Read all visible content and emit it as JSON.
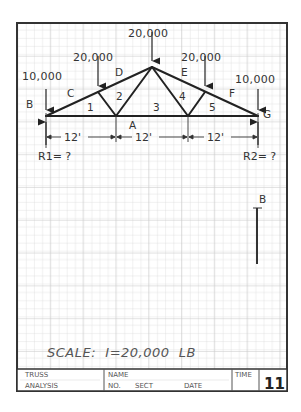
{
  "sheet": {
    "title_block": {
      "title_line1": "TRUSS",
      "title_line2": "ANALYSIS",
      "name_label": "NAME",
      "no_label": "NO.",
      "sect_label": "SECT",
      "date_label": "DATE",
      "time_label": "TIME",
      "sheet_number": "11"
    },
    "scale_text": "SCALE:  I=20,000  LB",
    "colors": {
      "grid_minor": "#dcdcdc",
      "grid_major": "#c4c4c4",
      "ink": "#222222",
      "frame": "#333333"
    }
  },
  "truss": {
    "loads": [
      {
        "id": "load-left-end",
        "value": "10,000"
      },
      {
        "id": "load-left-mid",
        "value": "20,000"
      },
      {
        "id": "load-apex",
        "value": "20,000"
      },
      {
        "id": "load-right-mid",
        "value": "20,000"
      },
      {
        "id": "load-right-end",
        "value": "10,000"
      }
    ],
    "space_labels": {
      "A": "A",
      "B": "B",
      "C": "C",
      "D": "D",
      "E": "E",
      "F": "F",
      "G": "G"
    },
    "panel_labels": [
      "1",
      "2",
      "3",
      "4",
      "5"
    ],
    "spans": [
      "12'",
      "12'",
      "12'"
    ],
    "reactions": {
      "left": "R1= ?",
      "right": "R2= ?"
    }
  },
  "force_diagram": {
    "start_label": "B"
  }
}
